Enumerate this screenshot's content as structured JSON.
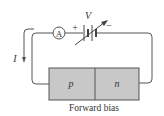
{
  "diagram": {
    "title": "Forward bias",
    "voltage_label": "V",
    "plus_label": "+",
    "minus_label": "−",
    "ammeter_label": "A",
    "current_label": "I",
    "regions": {
      "p_label": "p",
      "n_label": "n"
    },
    "colors": {
      "wire": "#555555",
      "junction_fill": "#c8c8c8",
      "junction_border": "#555555",
      "text": "#333333"
    }
  }
}
